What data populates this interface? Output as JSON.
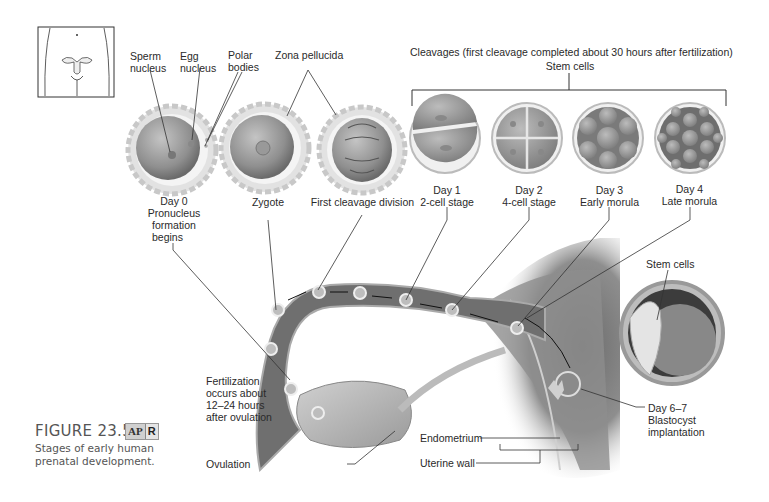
{
  "figure": {
    "number": "FIGURE 23.5",
    "badge_ap": "AP",
    "badge_r": "R",
    "caption_line1": "Stages of early human",
    "caption_line2": "prenatal development."
  },
  "labels": {
    "sperm_nucleus": [
      "Sperm",
      "nucleus"
    ],
    "egg_nucleus": [
      "Egg",
      "nucleus"
    ],
    "polar_bodies": [
      "Polar",
      "bodies"
    ],
    "zona_pellucida": "Zona pellucida",
    "cleavages": "Cleavages (first cleavage completed about 30 hours after fertilization)",
    "stem_cells_top": "Stem cells",
    "stem_cells_blastocyst": "Stem cells",
    "fertilization": [
      "Fertilization",
      "occurs about",
      "12–24 hours",
      "after ovulation"
    ],
    "ovulation": "Ovulation",
    "endometrium": "Endometrium",
    "uterine_wall": "Uterine wall",
    "blastocyst": [
      "Day 6–7",
      "Blastocyst",
      "implantation"
    ]
  },
  "stages": [
    {
      "name": "day0",
      "lines": [
        "Day 0",
        "Pronucleus",
        "formation",
        "begins"
      ]
    },
    {
      "name": "zygote",
      "lines": [
        "Zygote"
      ]
    },
    {
      "name": "first-cleavage",
      "lines": [
        "First cleavage division"
      ]
    },
    {
      "name": "day1",
      "lines": [
        "Day 1",
        "2-cell stage"
      ]
    },
    {
      "name": "day2",
      "lines": [
        "Day 2",
        "4-cell stage"
      ]
    },
    {
      "name": "day3",
      "lines": [
        "Day 3",
        "Early morula"
      ]
    },
    {
      "name": "day4",
      "lines": [
        "Day 4",
        "Late morula"
      ]
    }
  ],
  "colors": {
    "background": "#ffffff",
    "tube": "#6e6e6e",
    "tissue": "#8a8a8a",
    "cell": "#9a9a9a",
    "zona": "#d9d9d9",
    "leader": "#333333"
  }
}
